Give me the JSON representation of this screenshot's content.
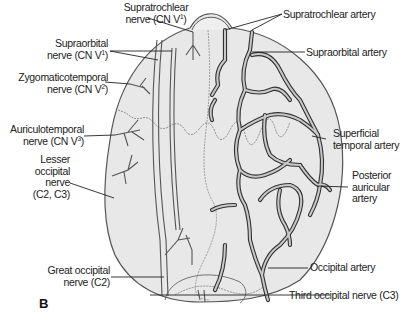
{
  "figure": {
    "panel_label": "B",
    "nerve_labels": [
      {
        "id": "supratrochlear-nerve",
        "line1": "Supratrochlear",
        "line2": "nerve (CN V",
        "sup": "1",
        "close": ")"
      },
      {
        "id": "supraorbital-nerve",
        "line1": "Supraorbital",
        "line2": "nerve (CN V",
        "sup": "1",
        "close": ")"
      },
      {
        "id": "zygomaticotemporal-nerve",
        "line1": "Zygomaticotemporal",
        "line2": "nerve (CN V",
        "sup": "2",
        "close": ")"
      },
      {
        "id": "auriculotemporal-nerve",
        "line1": "Auriculotemporal",
        "line2": "nerve (CN V",
        "sup": "3",
        "close": ")"
      },
      {
        "id": "lesser-occipital-nerve",
        "lines": [
          "Lesser",
          "occipital",
          "nerve",
          "(C2, C3)"
        ]
      },
      {
        "id": "great-occipital-nerve",
        "lines": [
          "Great occipital",
          "nerve (C2)"
        ]
      },
      {
        "id": "third-occipital-nerve",
        "lines": [
          "Third occipital nerve (C3)"
        ]
      }
    ],
    "artery_labels": [
      {
        "id": "supratrochlear-artery",
        "lines": [
          "Supratrochlear artery"
        ]
      },
      {
        "id": "supraorbital-artery",
        "lines": [
          "Supraorbital artery"
        ]
      },
      {
        "id": "superficial-temporal-artery",
        "lines": [
          "Superficial",
          "temporal artery"
        ]
      },
      {
        "id": "posterior-auricular-artery",
        "lines": [
          "Posterior",
          "auricular",
          "artery"
        ]
      },
      {
        "id": "occipital-artery",
        "lines": [
          "Occipital artery"
        ]
      }
    ],
    "colors": {
      "skin": "#e6e6e6",
      "outline": "#444444",
      "artery_fill": "#9a9a9a",
      "artery_stroke": "#333333",
      "nerve": "#555555",
      "text": "#222222"
    }
  }
}
